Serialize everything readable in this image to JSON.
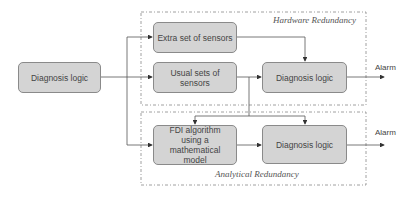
{
  "diagram": {
    "groups": {
      "hardware": {
        "label": "Hardware Redundancy"
      },
      "analytical": {
        "label": "Analytical Redundancy"
      }
    },
    "blocks": {
      "source": {
        "label": "Diagnosis logic"
      },
      "extra_sensors": {
        "label": "Extra set of sensors"
      },
      "usual_sensors": {
        "label": "Usual sets of sensors"
      },
      "hw_diagnosis": {
        "label": "Diagnosis logic"
      },
      "fdi": {
        "label": "FDI algorithm using a mathematical model"
      },
      "an_diagnosis": {
        "label": "Diagnosis logic"
      }
    },
    "outputs": {
      "hw_alarm": "Alarm",
      "an_alarm": "Alarm"
    },
    "colors": {
      "block_fill": "#d4d4d4",
      "block_border": "#8a8a8a",
      "line": "#555555"
    }
  }
}
